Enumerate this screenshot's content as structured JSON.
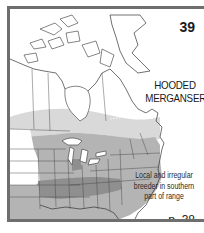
{
  "plate": {
    "number": "39",
    "species_name_line1": "HOODED",
    "species_name_line2": "MERGANSER",
    "note_line1": "Local and irregular",
    "note_line2": "breeder in southern",
    "note_line3": "part of range",
    "page_reference": "p. 38"
  },
  "map": {
    "region": "North America (Canada, USA, Greenland)",
    "legend_shades": {
      "northern_band": "#d9d9d9",
      "main_range": "#b4b4b4",
      "local_breeding": "#8f8f8f",
      "unshaded": "#ffffff"
    },
    "border_color": "#6e6e6e",
    "line_color": "#333333"
  }
}
